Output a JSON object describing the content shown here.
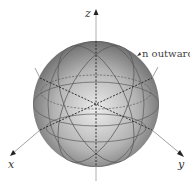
{
  "diagram": {
    "axes": {
      "z_label": "z",
      "x_label": "x",
      "y_label": "y"
    },
    "annotation": "n outward",
    "colors": {
      "sphere_light": "#e6e6e6",
      "sphere_dark": "#6e6e6e",
      "axis": "#888888",
      "grid": "#555555"
    }
  }
}
